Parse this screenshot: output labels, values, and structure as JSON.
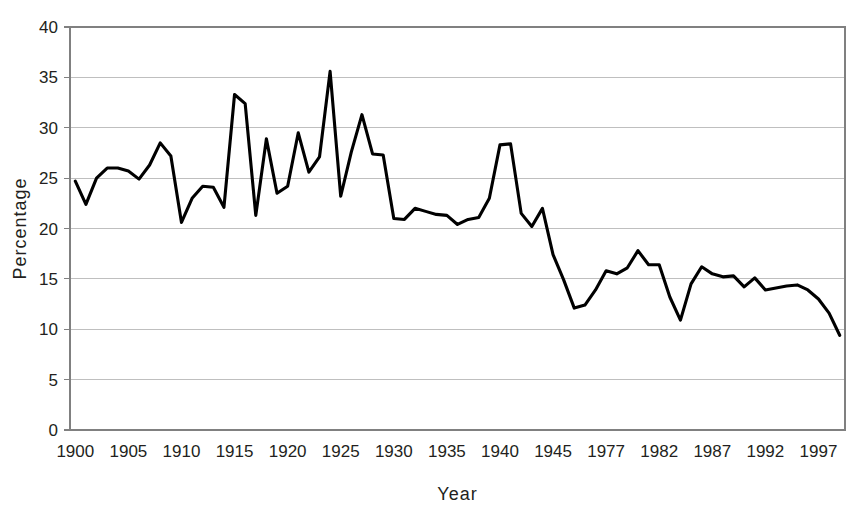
{
  "chart_data": {
    "type": "line",
    "title": "",
    "xlabel": "Year",
    "ylabel": "Percentage",
    "ylim": [
      0,
      40
    ],
    "ytick_step": 5,
    "yticks": [
      0,
      5,
      10,
      15,
      20,
      25,
      30,
      35,
      40
    ],
    "xticks": [
      1900,
      1905,
      1910,
      1915,
      1920,
      1925,
      1930,
      1935,
      1940,
      1945,
      1977,
      1982,
      1987,
      1992,
      1997
    ],
    "xtick_labels": [
      "1900",
      "1905",
      "1910",
      "1915",
      "1920",
      "1925",
      "1930",
      "1935",
      "1940",
      "1945",
      "1977",
      "1982",
      "1987",
      "1992",
      "1997"
    ],
    "note_axis_break": "Category axis: consecutive years 1900-1946 then 1975-2000; tick labels shown every 5 categories",
    "grid": "horizontal",
    "legend": "none",
    "line_color": "#000000",
    "x": [
      1900,
      1901,
      1902,
      1903,
      1904,
      1905,
      1906,
      1907,
      1908,
      1909,
      1910,
      1911,
      1912,
      1913,
      1914,
      1915,
      1916,
      1917,
      1918,
      1919,
      1920,
      1921,
      1922,
      1923,
      1924,
      1925,
      1926,
      1927,
      1928,
      1929,
      1930,
      1931,
      1932,
      1933,
      1934,
      1935,
      1936,
      1937,
      1938,
      1939,
      1940,
      1941,
      1942,
      1943,
      1944,
      1945,
      1946,
      1975,
      1976,
      1977,
      1978,
      1979,
      1980,
      1981,
      1982,
      1983,
      1984,
      1985,
      1986,
      1987,
      1988,
      1989,
      1990,
      1991,
      1992,
      1993,
      1994,
      1995,
      1996,
      1997,
      1998,
      1999,
      2000
    ],
    "categories": [
      "1900",
      "1901",
      "1902",
      "1903",
      "1904",
      "1905",
      "1906",
      "1907",
      "1908",
      "1909",
      "1910",
      "1911",
      "1912",
      "1913",
      "1914",
      "1915",
      "1916",
      "1917",
      "1918",
      "1919",
      "1920",
      "1921",
      "1922",
      "1923",
      "1924",
      "1925",
      "1926",
      "1927",
      "1928",
      "1929",
      "1930",
      "1931",
      "1932",
      "1933",
      "1934",
      "1935",
      "1936",
      "1937",
      "1938",
      "1939",
      "1940",
      "1941",
      "1942",
      "1943",
      "1944",
      "1945",
      "1946",
      "1975",
      "1976",
      "1977",
      "1978",
      "1979",
      "1980",
      "1981",
      "1982",
      "1983",
      "1984",
      "1985",
      "1986",
      "1987",
      "1988",
      "1989",
      "1990",
      "1991",
      "1992",
      "1993",
      "1994",
      "1995",
      "1996",
      "1997",
      "1998",
      "1999",
      "2000"
    ],
    "values": [
      24.7,
      22.4,
      25.0,
      26.0,
      26.0,
      25.7,
      24.9,
      26.3,
      28.5,
      27.2,
      20.6,
      23.0,
      24.2,
      24.1,
      22.1,
      33.3,
      32.4,
      21.3,
      28.9,
      23.5,
      24.2,
      29.5,
      25.6,
      27.1,
      35.6,
      23.2,
      27.6,
      31.3,
      27.4,
      27.3,
      21.0,
      20.9,
      22.0,
      21.7,
      21.4,
      21.3,
      20.4,
      20.9,
      21.1,
      23.0,
      28.3,
      28.4,
      21.5,
      20.2,
      22.0,
      17.4,
      14.9,
      12.1,
      12.4,
      13.9,
      15.8,
      15.5,
      16.1,
      17.8,
      16.4,
      16.4,
      13.2,
      10.9,
      14.5,
      16.2,
      15.5,
      15.2,
      15.3,
      14.2,
      15.1,
      13.9,
      14.1,
      14.3,
      14.4,
      13.9,
      13.0,
      11.6,
      9.4
    ],
    "series": [
      {
        "name": "Percentage",
        "values": [
          24.7,
          22.4,
          25.0,
          26.0,
          26.0,
          25.7,
          24.9,
          26.3,
          28.5,
          27.2,
          20.6,
          23.0,
          24.2,
          24.1,
          22.1,
          33.3,
          32.4,
          21.3,
          28.9,
          23.5,
          24.2,
          29.5,
          25.6,
          27.1,
          35.6,
          23.2,
          27.6,
          31.3,
          27.4,
          27.3,
          21.0,
          20.9,
          22.0,
          21.7,
          21.4,
          21.3,
          20.4,
          20.9,
          21.1,
          23.0,
          28.3,
          28.4,
          21.5,
          20.2,
          22.0,
          17.4,
          14.9,
          12.1,
          12.4,
          13.9,
          15.8,
          15.5,
          16.1,
          17.8,
          16.4,
          16.4,
          13.2,
          10.9,
          14.5,
          16.2,
          15.5,
          15.2,
          15.3,
          14.2,
          15.1,
          13.9,
          14.1,
          14.3,
          14.4,
          13.9,
          13.0,
          11.6,
          9.4
        ]
      }
    ]
  }
}
